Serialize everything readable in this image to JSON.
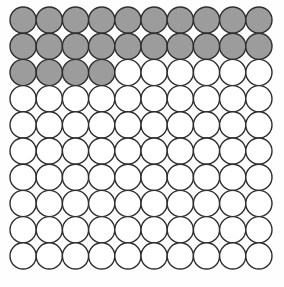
{
  "figure": {
    "name": "hundred-circle-grid",
    "background_color": "#fefefe"
  },
  "chart_data": {
    "type": "heatmap",
    "title": "",
    "subtitle": "",
    "xlabel": "",
    "ylabel": "",
    "rows": 10,
    "columns": 10,
    "total_cells": 100,
    "shaded_cells": 24,
    "unshaded_cells": 76,
    "shaded_fraction": "24/100",
    "shaded_percent": 24,
    "categories": [
      "col1",
      "col2",
      "col3",
      "col4",
      "col5",
      "col6",
      "col7",
      "col8",
      "col9",
      "col10"
    ],
    "row_labels": [
      "row1",
      "row2",
      "row3",
      "row4",
      "row5",
      "row6",
      "row7",
      "row8",
      "row9",
      "row10"
    ],
    "shaded_per_row": [
      10,
      10,
      4,
      0,
      0,
      0,
      0,
      0,
      0,
      0
    ],
    "values": [
      [
        1,
        1,
        1,
        1,
        1,
        1,
        1,
        1,
        1,
        1
      ],
      [
        1,
        1,
        1,
        1,
        1,
        1,
        1,
        1,
        1,
        1
      ],
      [
        1,
        1,
        1,
        1,
        0,
        0,
        0,
        0,
        0,
        0
      ],
      [
        0,
        0,
        0,
        0,
        0,
        0,
        0,
        0,
        0,
        0
      ],
      [
        0,
        0,
        0,
        0,
        0,
        0,
        0,
        0,
        0,
        0
      ],
      [
        0,
        0,
        0,
        0,
        0,
        0,
        0,
        0,
        0,
        0
      ],
      [
        0,
        0,
        0,
        0,
        0,
        0,
        0,
        0,
        0,
        0
      ],
      [
        0,
        0,
        0,
        0,
        0,
        0,
        0,
        0,
        0,
        0
      ],
      [
        0,
        0,
        0,
        0,
        0,
        0,
        0,
        0,
        0,
        0
      ],
      [
        0,
        0,
        0,
        0,
        0,
        0,
        0,
        0,
        0,
        0
      ]
    ],
    "legend": [],
    "grid": false,
    "colors": {
      "shaded": "#9c9c9c",
      "unshaded": "#ffffff",
      "outline": "#2e2e2e"
    },
    "geometry": {
      "origin_x": 10,
      "origin_y": 7,
      "cell_pitch": 26.2,
      "circle_radius": 13.1
    }
  }
}
